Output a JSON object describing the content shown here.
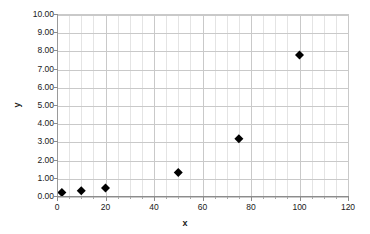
{
  "chart_data": {
    "type": "scatter",
    "title": "",
    "xlabel": "x",
    "ylabel": "y",
    "xlim": [
      0,
      120
    ],
    "ylim": [
      0,
      10
    ],
    "x_ticks": [
      0,
      20,
      40,
      60,
      80,
      100,
      120
    ],
    "x_tick_labels": [
      "0",
      "20",
      "40",
      "60",
      "80",
      "100",
      "120"
    ],
    "y_ticks": [
      0,
      1,
      2,
      3,
      4,
      5,
      6,
      7,
      8,
      9,
      10
    ],
    "y_tick_labels": [
      "0.00",
      "1.00",
      "2.00",
      "3.00",
      "4.00",
      "5.00",
      "6.00",
      "7.00",
      "8.00",
      "9.00",
      "10.00"
    ],
    "x_minor_step": 5,
    "y_minor_step": 1,
    "grid": true,
    "grid_color": "#c9c9c9",
    "minor_grid_color": "#e4e4e4",
    "legend": false,
    "marker": "diamond",
    "marker_color": "#000000",
    "marker_size": 9,
    "series": [
      {
        "name": "Series 1",
        "points": [
          {
            "x": 2,
            "y": 0.25
          },
          {
            "x": 10,
            "y": 0.35
          },
          {
            "x": 20,
            "y": 0.5
          },
          {
            "x": 50,
            "y": 1.35
          },
          {
            "x": 75,
            "y": 3.2
          },
          {
            "x": 100,
            "y": 7.8
          }
        ]
      }
    ]
  },
  "axes": {
    "x_title": "x",
    "y_title": "y"
  }
}
